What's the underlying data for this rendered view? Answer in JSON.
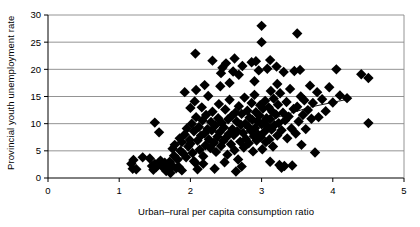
{
  "chart_data": {
    "type": "scatter",
    "title": "",
    "xlabel": "Urban–rural per capita consumption ratio",
    "ylabel": "Provincial youth unemployment rate",
    "xlim": [
      0,
      5
    ],
    "ylim": [
      0,
      30
    ],
    "xticks": [
      0,
      1,
      2,
      3,
      4,
      5
    ],
    "yticks": [
      0,
      5,
      10,
      15,
      20,
      25,
      30
    ],
    "xtick_labels": [
      "0",
      "1",
      "2",
      "3",
      "4",
      "5"
    ],
    "ytick_labels": [
      "0",
      "5",
      "10",
      "15",
      "20",
      "25",
      "30"
    ],
    "grid": "horizontal",
    "legend": "none",
    "marker": "diamond",
    "marker_color": "#000000",
    "marker_size": 5.2,
    "trendline": {
      "present": true,
      "style": "solid-thin",
      "color": "#000000",
      "description": "upward sloping fitted line across the cluster",
      "points": [
        [
          1.62,
          1.9
        ],
        [
          2.0,
          4.3
        ],
        [
          2.35,
          6.6
        ],
        [
          2.75,
          9.0
        ],
        [
          3.2,
          11.1
        ],
        [
          3.7,
          13.1
        ],
        [
          4.25,
          14.6
        ]
      ]
    },
    "points": [
      [
        1.17,
        2.6
      ],
      [
        1.19,
        1.7
      ],
      [
        1.2,
        3.3
      ],
      [
        1.24,
        1.6
      ],
      [
        1.43,
        3.6
      ],
      [
        1.46,
        2.2
      ],
      [
        1.48,
        1.5
      ],
      [
        1.5,
        2.6
      ],
      [
        1.5,
        10.2
      ],
      [
        1.52,
        2.0
      ],
      [
        1.55,
        2.5
      ],
      [
        1.56,
        8.4
      ],
      [
        1.58,
        3.2
      ],
      [
        1.6,
        2.4
      ],
      [
        1.62,
        1.9
      ],
      [
        1.64,
        2.8
      ],
      [
        1.66,
        1.3
      ],
      [
        1.68,
        2.1
      ],
      [
        1.7,
        1.5
      ],
      [
        1.71,
        3.0
      ],
      [
        1.72,
        0.9
      ],
      [
        1.74,
        2.3
      ],
      [
        1.75,
        5.4
      ],
      [
        1.77,
        4.1
      ],
      [
        1.78,
        6.1
      ],
      [
        1.8,
        1.8
      ],
      [
        1.82,
        3.4
      ],
      [
        1.84,
        2.0
      ],
      [
        1.85,
        7.3
      ],
      [
        1.86,
        5.0
      ],
      [
        1.88,
        6.6
      ],
      [
        1.9,
        4.5
      ],
      [
        1.92,
        8.0
      ],
      [
        1.94,
        3.8
      ],
      [
        1.95,
        9.1
      ],
      [
        1.97,
        5.8
      ],
      [
        1.99,
        7.0
      ],
      [
        2.0,
        12.9
      ],
      [
        2.0,
        6.3
      ],
      [
        2.02,
        10.0
      ],
      [
        2.03,
        4.6
      ],
      [
        2.05,
        8.6
      ],
      [
        2.06,
        14.1
      ],
      [
        2.07,
        2.8
      ],
      [
        2.08,
        11.2
      ],
      [
        2.1,
        6.9
      ],
      [
        2.1,
        1.6
      ],
      [
        2.12,
        9.4
      ],
      [
        2.13,
        5.2
      ],
      [
        2.15,
        7.8
      ],
      [
        2.16,
        13.0
      ],
      [
        2.17,
        10.6
      ],
      [
        2.18,
        4.0
      ],
      [
        2.2,
        8.2
      ],
      [
        2.21,
        6.0
      ],
      [
        2.22,
        11.6
      ],
      [
        2.24,
        9.0
      ],
      [
        2.25,
        15.1
      ],
      [
        2.26,
        7.1
      ],
      [
        2.28,
        5.5
      ],
      [
        2.29,
        10.3
      ],
      [
        2.3,
        8.8
      ],
      [
        2.31,
        12.2
      ],
      [
        2.33,
        6.5
      ],
      [
        2.34,
        1.7
      ],
      [
        2.35,
        9.7
      ],
      [
        2.36,
        4.8
      ],
      [
        2.38,
        7.6
      ],
      [
        2.39,
        11.0
      ],
      [
        2.4,
        13.6
      ],
      [
        2.41,
        8.4
      ],
      [
        2.43,
        5.9
      ],
      [
        2.44,
        10.1
      ],
      [
        2.45,
        20.3
      ],
      [
        2.46,
        6.8
      ],
      [
        2.47,
        9.3
      ],
      [
        2.49,
        12.6
      ],
      [
        2.5,
        7.4
      ],
      [
        2.5,
        21.1
      ],
      [
        2.52,
        4.3
      ],
      [
        2.53,
        10.8
      ],
      [
        2.54,
        8.1
      ],
      [
        2.55,
        14.4
      ],
      [
        2.57,
        6.2
      ],
      [
        2.58,
        11.4
      ],
      [
        2.59,
        9.0
      ],
      [
        2.6,
        19.6
      ],
      [
        2.61,
        7.9
      ],
      [
        2.62,
        5.1
      ],
      [
        2.63,
        12.0
      ],
      [
        2.64,
        1.2
      ],
      [
        2.65,
        10.4
      ],
      [
        2.66,
        8.6
      ],
      [
        2.67,
        3.4
      ],
      [
        2.68,
        13.2
      ],
      [
        2.7,
        6.7
      ],
      [
        2.71,
        9.8
      ],
      [
        2.72,
        11.8
      ],
      [
        2.73,
        20.6
      ],
      [
        2.74,
        8.3
      ],
      [
        2.75,
        5.6
      ],
      [
        2.76,
        14.8
      ],
      [
        2.77,
        10.0
      ],
      [
        2.78,
        7.2
      ],
      [
        2.8,
        12.4
      ],
      [
        2.81,
        9.5
      ],
      [
        2.82,
        6.4
      ],
      [
        2.83,
        11.1
      ],
      [
        2.85,
        8.7
      ],
      [
        2.86,
        13.8
      ],
      [
        2.87,
        10.7
      ],
      [
        2.88,
        4.9
      ],
      [
        2.89,
        7.7
      ],
      [
        2.9,
        15.3
      ],
      [
        2.91,
        9.2
      ],
      [
        2.92,
        12.1
      ],
      [
        2.93,
        6.9
      ],
      [
        2.94,
        10.5
      ],
      [
        2.95,
        8.0
      ],
      [
        2.96,
        19.8
      ],
      [
        2.97,
        11.5
      ],
      [
        2.98,
        13.4
      ],
      [
        2.99,
        7.5
      ],
      [
        3.0,
        28.0
      ],
      [
        3.0,
        9.9
      ],
      [
        3.01,
        5.3
      ],
      [
        3.02,
        12.8
      ],
      [
        3.03,
        10.2
      ],
      [
        3.04,
        8.5
      ],
      [
        3.05,
        14.2
      ],
      [
        3.06,
        6.6
      ],
      [
        3.07,
        11.0
      ],
      [
        3.08,
        20.1
      ],
      [
        3.09,
        9.4
      ],
      [
        3.1,
        13.0
      ],
      [
        3.11,
        7.1
      ],
      [
        3.12,
        10.8
      ],
      [
        3.13,
        16.0
      ],
      [
        3.14,
        8.9
      ],
      [
        3.15,
        12.2
      ],
      [
        3.16,
        5.8
      ],
      [
        3.17,
        14.6
      ],
      [
        3.18,
        9.7
      ],
      [
        3.2,
        11.7
      ],
      [
        3.21,
        20.5
      ],
      [
        3.22,
        7.8
      ],
      [
        3.23,
        13.5
      ],
      [
        3.24,
        10.1
      ],
      [
        3.25,
        2.4
      ],
      [
        3.26,
        15.6
      ],
      [
        3.28,
        8.8
      ],
      [
        3.3,
        12.0
      ],
      [
        3.31,
        19.5
      ],
      [
        3.32,
        2.2
      ],
      [
        3.33,
        10.6
      ],
      [
        3.35,
        14.0
      ],
      [
        3.36,
        7.3
      ],
      [
        3.38,
        11.3
      ],
      [
        3.4,
        16.4
      ],
      [
        3.42,
        9.1
      ],
      [
        3.43,
        2.3
      ],
      [
        3.45,
        12.7
      ],
      [
        3.46,
        19.7
      ],
      [
        3.48,
        8.2
      ],
      [
        3.5,
        26.6
      ],
      [
        3.5,
        13.1
      ],
      [
        3.52,
        10.4
      ],
      [
        3.54,
        19.9
      ],
      [
        3.55,
        15.0
      ],
      [
        3.56,
        6.1
      ],
      [
        3.58,
        11.6
      ],
      [
        3.6,
        14.3
      ],
      [
        3.62,
        9.0
      ],
      [
        3.65,
        12.5
      ],
      [
        3.68,
        17.0
      ],
      [
        3.7,
        10.9
      ],
      [
        3.72,
        13.8
      ],
      [
        3.75,
        4.7
      ],
      [
        3.78,
        15.8
      ],
      [
        3.8,
        11.2
      ],
      [
        3.85,
        14.5
      ],
      [
        3.9,
        12.3
      ],
      [
        3.95,
        16.7
      ],
      [
        4.0,
        13.9
      ],
      [
        4.05,
        20.0
      ],
      [
        4.1,
        15.2
      ],
      [
        4.2,
        14.7
      ],
      [
        4.4,
        19.1
      ],
      [
        4.5,
        18.4
      ],
      [
        4.5,
        10.1
      ],
      [
        2.07,
        22.9
      ],
      [
        2.31,
        21.6
      ],
      [
        2.62,
        22.0
      ],
      [
        2.86,
        21.3
      ],
      [
        2.92,
        21.5
      ],
      [
        3.12,
        21.7
      ],
      [
        2.43,
        19.3
      ],
      [
        2.68,
        19.0
      ],
      [
        3.0,
        25.0
      ],
      [
        1.92,
        15.8
      ],
      [
        2.08,
        16.2
      ],
      [
        2.2,
        17.1
      ],
      [
        2.55,
        17.5
      ],
      [
        2.9,
        17.8
      ],
      [
        3.22,
        17.3
      ],
      [
        2.42,
        16.9
      ],
      [
        2.05,
        3.1
      ],
      [
        2.18,
        2.6
      ],
      [
        2.48,
        2.9
      ],
      [
        2.72,
        2.1
      ],
      [
        3.12,
        3.0
      ],
      [
        3.28,
        1.9
      ],
      [
        1.33,
        3.8
      ],
      [
        1.88,
        1.4
      ]
    ]
  }
}
